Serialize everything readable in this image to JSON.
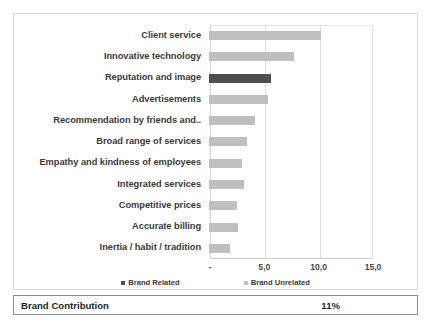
{
  "chart_data": {
    "type": "bar",
    "orientation": "horizontal",
    "title": "",
    "xlabel": "",
    "ylabel": "",
    "xlim": [
      0,
      15
    ],
    "xticks": [
      "-",
      "5,0",
      "10,0",
      "15,0"
    ],
    "xtick_values": [
      0,
      5,
      10,
      15
    ],
    "grid": true,
    "legend_position": "bottom",
    "legend": [
      {
        "name": "Brand Related",
        "color": "#4f4f4f"
      },
      {
        "name": "Brand Unrelated",
        "color": "#bfbfbf"
      }
    ],
    "categories": [
      "Client service",
      "Innovative technology",
      "Reputation and image",
      "Advertisements",
      "Recommendation by friends and..",
      "Broad range of services",
      "Empathy and kindness of employees",
      "Integrated services",
      "Competitive prices",
      "Accurate billing",
      "Inertia / habit / tradition"
    ],
    "values": [
      10.3,
      7.8,
      5.7,
      5.4,
      4.2,
      3.5,
      3.0,
      3.2,
      2.6,
      2.7,
      1.9
    ],
    "series_of_point": [
      "Brand Unrelated",
      "Brand Unrelated",
      "Brand Related",
      "Brand Unrelated",
      "Brand Unrelated",
      "Brand Unrelated",
      "Brand Unrelated",
      "Brand Unrelated",
      "Brand Unrelated",
      "Brand Unrelated",
      "Brand Unrelated"
    ]
  },
  "footer": {
    "label": "Brand Contribution",
    "value": "11%"
  },
  "colors": {
    "brand_related": "#4f4f4f",
    "brand_unrelated": "#bfbfbf",
    "panel_border": "#d9d9d9",
    "footer_border": "#8c8c8c",
    "gridline": "#e0e0e0"
  }
}
